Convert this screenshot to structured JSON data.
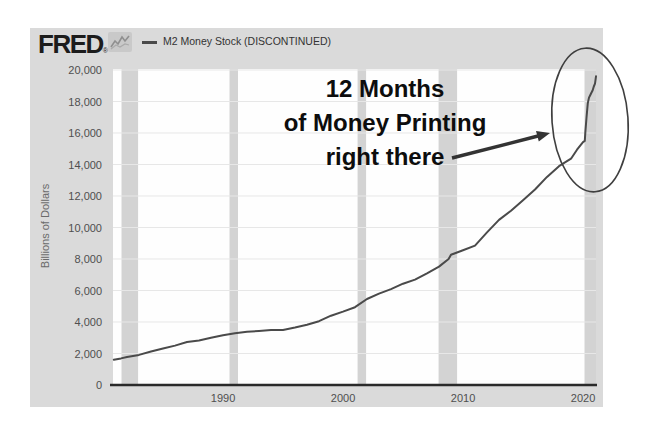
{
  "header": {
    "logo_text": "FRED",
    "logo_reg": "®",
    "legend_label": "M2 Money Stock (DISCONTINUED)"
  },
  "annotation": {
    "lines": [
      "12 Months",
      "of Money Printing",
      "right there"
    ]
  },
  "y_axis": {
    "title": "Billions of Dollars",
    "tick_values": [
      0,
      2000,
      4000,
      6000,
      8000,
      10000,
      12000,
      14000,
      16000,
      18000,
      20000
    ],
    "tick_labels": [
      "0",
      "2,000",
      "4,000",
      "6,000",
      "8,000",
      "10,000",
      "12,000",
      "14,000",
      "16,000",
      "18,000",
      "20,000"
    ]
  },
  "x_axis": {
    "tick_values": [
      1990,
      2000,
      2010,
      2020
    ],
    "tick_labels": [
      "1990",
      "2000",
      "2010",
      "2020"
    ]
  },
  "colors": {
    "chart_bg": "#dadada",
    "plot_bg": "#fefefe",
    "series_line": "#4a4a4a",
    "recession_band": "#d3d3d3",
    "gridline": "#e7e7e7",
    "axis_line": "#2a2a2a",
    "annotation_text": "#0d0d0d",
    "arrow": "#333333",
    "ellipse_stroke": "#3f3f3f",
    "tick_label": "#4f4f4f",
    "legend_text": "#333333",
    "logo": "#1c1c1c"
  },
  "chart_data": {
    "type": "line",
    "title": "",
    "xlabel": "",
    "ylabel": "Billions of Dollars",
    "x_range": [
      1980.83,
      2021.08
    ],
    "y_range": [
      0,
      20000
    ],
    "grid": "horizontal",
    "legend_position": "top-left",
    "recession_bands": [
      [
        1981.54,
        1982.92
      ],
      [
        1990.54,
        1991.25
      ],
      [
        2001.21,
        2001.92
      ],
      [
        2007.96,
        2009.5
      ],
      [
        2020.12,
        2021.08
      ]
    ],
    "series": [
      {
        "name": "M2 Money Stock (DISCONTINUED)",
        "points": [
          [
            1980.9,
            1600
          ],
          [
            1981.5,
            1690
          ],
          [
            1982,
            1780
          ],
          [
            1983,
            1910
          ],
          [
            1984,
            2130
          ],
          [
            1985,
            2320
          ],
          [
            1986,
            2500
          ],
          [
            1987,
            2730
          ],
          [
            1988,
            2830
          ],
          [
            1989,
            3000
          ],
          [
            1990,
            3160
          ],
          [
            1991,
            3280
          ],
          [
            1992,
            3380
          ],
          [
            1993,
            3430
          ],
          [
            1994,
            3490
          ],
          [
            1995,
            3500
          ],
          [
            1996,
            3650
          ],
          [
            1997,
            3820
          ],
          [
            1998,
            4050
          ],
          [
            1999,
            4400
          ],
          [
            2000,
            4660
          ],
          [
            2001,
            4940
          ],
          [
            2002,
            5460
          ],
          [
            2003,
            5800
          ],
          [
            2004,
            6090
          ],
          [
            2005,
            6430
          ],
          [
            2006,
            6690
          ],
          [
            2007,
            7090
          ],
          [
            2008,
            7520
          ],
          [
            2008.8,
            8000
          ],
          [
            2009,
            8270
          ],
          [
            2010,
            8550
          ],
          [
            2011,
            8850
          ],
          [
            2012,
            9690
          ],
          [
            2013,
            10480
          ],
          [
            2014,
            11060
          ],
          [
            2015,
            11730
          ],
          [
            2016,
            12410
          ],
          [
            2017,
            13210
          ],
          [
            2018,
            13890
          ],
          [
            2019,
            14370
          ],
          [
            2019.5,
            14940
          ],
          [
            2020,
            15420
          ],
          [
            2020.15,
            15500
          ],
          [
            2020.2,
            16100
          ],
          [
            2020.3,
            17050
          ],
          [
            2020.4,
            17900
          ],
          [
            2020.5,
            18250
          ],
          [
            2020.6,
            18400
          ],
          [
            2020.7,
            18550
          ],
          [
            2020.8,
            18700
          ],
          [
            2020.9,
            18950
          ],
          [
            2021.0,
            19130
          ],
          [
            2021.08,
            19600
          ]
        ]
      }
    ]
  }
}
